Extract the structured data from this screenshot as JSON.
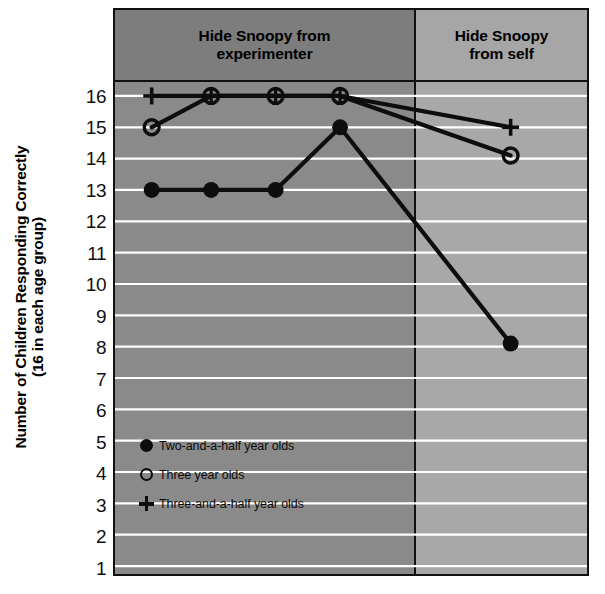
{
  "figure": {
    "ylabel_line1": "Number of Children Responding Correctly",
    "ylabel_line2": "(16 in each age group)"
  },
  "panels": [
    {
      "id": "experimenter",
      "title_line1": "Hide Snoopy from",
      "title_line2": "experimenter",
      "bg": "#8a8a8a"
    },
    {
      "id": "self",
      "title_line1": "Hide Snoopy",
      "title_line2": "from self",
      "bg": "#a8a8a8"
    }
  ],
  "legend": {
    "items": [
      {
        "marker": "filled-circle",
        "label": "Two-and-a-half year olds"
      },
      {
        "marker": "open-circle",
        "label": "Three year olds"
      },
      {
        "marker": "plus",
        "label": "Three-and-a-half year olds"
      }
    ]
  },
  "yticks": [
    "16",
    "15",
    "14",
    "13",
    "12",
    "11",
    "10",
    "9",
    "8",
    "7",
    "6",
    "5",
    "4",
    "3",
    "2",
    "1"
  ],
  "chart_data": {
    "type": "line",
    "title": "",
    "xlabel": "",
    "ylabel": "Number of Children Responding Correctly (16 in each age group)",
    "ylim": [
      1,
      16
    ],
    "grid": true,
    "gridline_color": "#ffffff",
    "legend_position": "inside-lower-left",
    "x": [
      1,
      2,
      3,
      4,
      5
    ],
    "panel_split_after_x": 4,
    "panel_labels": [
      "Hide Snoopy from experimenter",
      "Hide Snoopy from self"
    ],
    "series": [
      {
        "name": "Two-and-a-half year olds",
        "marker": "filled-circle",
        "values": [
          13,
          13,
          13,
          15,
          8.1
        ]
      },
      {
        "name": "Three year olds",
        "marker": "open-circle",
        "values": [
          15,
          16,
          16,
          16,
          14.1
        ]
      },
      {
        "name": "Three-and-a-half year olds",
        "marker": "plus",
        "values": [
          16,
          16,
          16,
          16,
          15
        ]
      }
    ]
  },
  "colors": {
    "line": "#0d0d0d",
    "panel_left_bg": "#8a8a8a",
    "panel_right_bg": "#a8a8a8",
    "header_left_bg": "#7d7d7d",
    "header_right_bg": "#a6a6a6",
    "frame": "#111111",
    "gridline": "#ffffff"
  }
}
